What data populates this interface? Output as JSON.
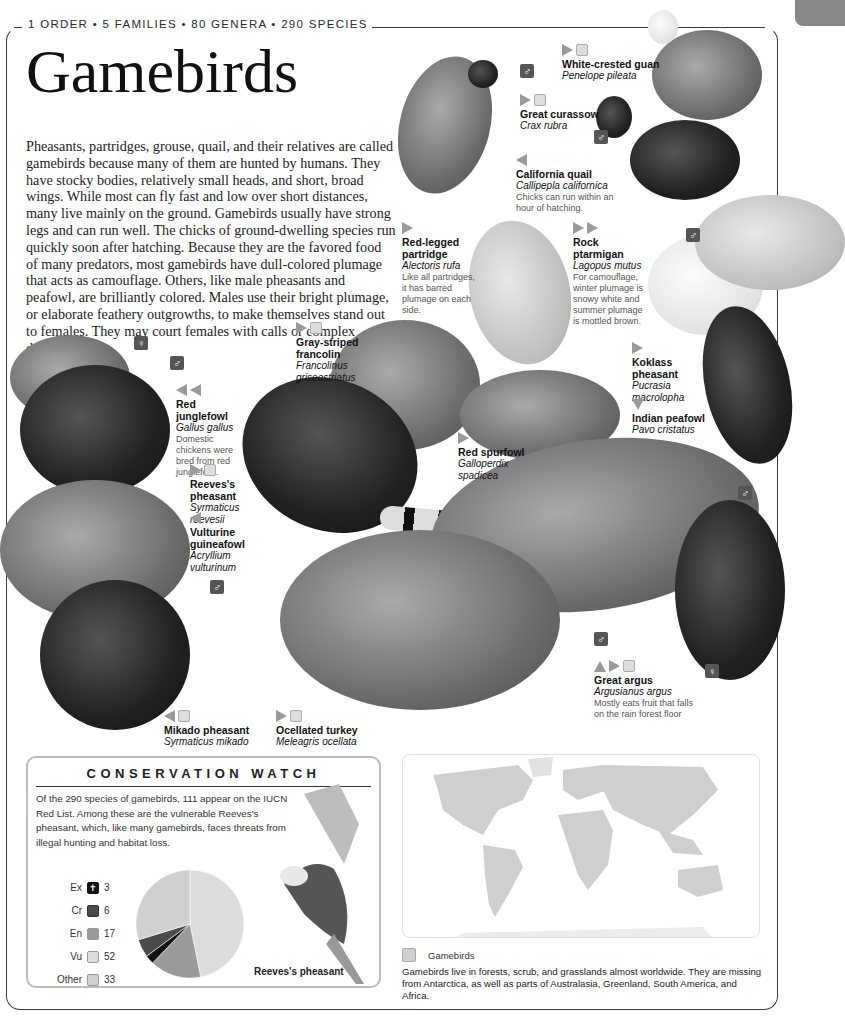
{
  "header": {
    "stats": "1 ORDER • 5 FAMILIES • 80 GENERA • 290 SPECIES",
    "title": "Gamebirds",
    "intro": "Pheasants, partridges, grouse, quail, and their relatives are called gamebirds because many of them are hunted by humans. They have stocky bodies, relatively small heads, and short, broad wings. While most can fly fast and low over short distances, many live mainly on the ground. Gamebirds usually have strong legs and can run well. The chicks of ground-dwelling species run quickly soon after hatching. Because they are the favored food of many predators, most gamebirds have dull-colored plumage that acts as camouflage. Others, like male pheasants and peafowl, are brilliantly colored. Males use their bright plumage, or elaborate feathery outgrowths, to make themselves stand out to females. They may court females with calls or complex dances."
  },
  "sex_symbols": {
    "male": "♂",
    "female": "♀"
  },
  "species": [
    {
      "common": "White-crested guan",
      "scientific": "Penelope pileata",
      "note": "",
      "trend": [
        "right"
      ],
      "status": true
    },
    {
      "common": "Great curassow",
      "scientific": "Crax rubra",
      "note": "",
      "trend": [
        "right"
      ],
      "status": true
    },
    {
      "common": "California quail",
      "scientific": "Callipepla californica",
      "note": "Chicks can run within an hour of hatching.",
      "trend": [
        "left"
      ],
      "status": false
    },
    {
      "common": "Red-legged partridge",
      "scientific": "Alectoris rufa",
      "note": "Like all partridges, it has barred plumage on each side.",
      "trend": [
        "right"
      ],
      "status": false
    },
    {
      "common": "Rock ptarmigan",
      "scientific": "Lagopus mutus",
      "note": "For camouflage, winter plumage is snowy white and summer plumage is mottled brown.",
      "trend": [
        "right",
        "right"
      ],
      "status": false
    },
    {
      "common": "Gray-striped francolin",
      "scientific": "Francolinus griseostriatus",
      "note": "",
      "trend": [
        "right"
      ],
      "status": true
    },
    {
      "common": "Koklass pheasant",
      "scientific": "Pucrasia macrolopha",
      "note": "",
      "trend": [
        "right"
      ],
      "status": false
    },
    {
      "common": "Indian peafowl",
      "scientific": "Pavo cristatus",
      "note": "",
      "trend": [
        "down"
      ],
      "status": false
    },
    {
      "common": "Red junglefowl",
      "scientific": "Gallus gallus",
      "note": "Domestic chickens were bred from red junglefowl.",
      "trend": [
        "left",
        "left"
      ],
      "status": false
    },
    {
      "common": "Reeves's pheasant",
      "scientific": "Syrmaticus reevesii",
      "note": "",
      "trend": [
        "right"
      ],
      "status": true
    },
    {
      "common": "Vulturine guineafowl",
      "scientific": "Acryllium vulturinum",
      "note": "",
      "trend": [
        "left"
      ],
      "status": false
    },
    {
      "common": "Red spurfowl",
      "scientific": "Galloperdix spadicea",
      "note": "",
      "trend": [
        "right"
      ],
      "status": false
    },
    {
      "common": "Great argus",
      "scientific": "Argusianus argus",
      "note": "Mostly eats fruit that falls on the rain forest floor",
      "trend": [
        "up",
        "right"
      ],
      "status": true
    },
    {
      "common": "Mikado pheasant",
      "scientific": "Syrmaticus mikado",
      "note": "",
      "trend": [
        "left"
      ],
      "status": true
    },
    {
      "common": "Ocellated turkey",
      "scientific": "Meleagris ocellata",
      "note": "",
      "trend": [
        "right"
      ],
      "status": true
    }
  ],
  "conservation": {
    "title": "CONSERVATION WATCH",
    "text": "Of the 290 species of gamebirds, 111 appear on the IUCN Red List. Among these are the vulnerable Reeves's pheasant, which, like many gamebirds, faces threats from illegal hunting and habitat loss.",
    "caption": "Reeves's pheasant",
    "legend": [
      {
        "code": "Ex",
        "count": "3",
        "color": "#111111"
      },
      {
        "code": "Cr",
        "count": "6",
        "color": "#4a4a4a"
      },
      {
        "code": "En",
        "count": "17",
        "color": "#9a9a9a"
      },
      {
        "code": "Vu",
        "count": "52",
        "color": "#d9d9d9"
      },
      {
        "code": "Other",
        "count": "33",
        "color": "#cfcfcf"
      }
    ]
  },
  "chart_data": {
    "type": "pie",
    "title": "CONSERVATION WATCH",
    "categories": [
      "Ex",
      "Cr",
      "En",
      "Vu",
      "Other"
    ],
    "values": [
      3,
      6,
      17,
      52,
      33
    ],
    "colors": [
      "#111111",
      "#4a4a4a",
      "#9a9a9a",
      "#dcdcdc",
      "#d0d0d0"
    ]
  },
  "map": {
    "legend_label": "Gamebirds",
    "text": "Gamebirds live in forests, scrub, and grasslands almost worldwide. They are missing from Antarctica, as well as parts of Australasia, Greenland, South America, and Africa."
  }
}
